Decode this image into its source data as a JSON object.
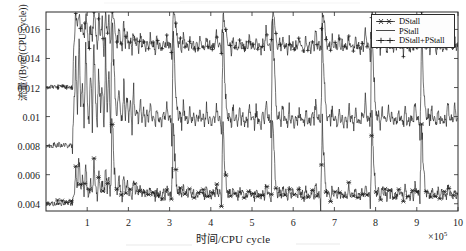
{
  "chart_data": {
    "type": "line",
    "title": "",
    "xlabel": "时间/CPU cycle",
    "ylabel": "流量/(Byte/(CPU cycle))",
    "x_exponent_label": "×10",
    "x_exponent_power": "5",
    "xlim": [
      0,
      10
    ],
    "ylim": [
      0.0035,
      0.0172
    ],
    "grid": false,
    "legend_position": "top-right",
    "x_ticks": [
      1,
      2,
      3,
      4,
      5,
      6,
      7,
      8,
      9,
      10
    ],
    "x_tick_labels": [
      "1",
      "2",
      "3",
      "4",
      "5",
      "6",
      "7",
      "8",
      "9",
      "10"
    ],
    "y_ticks": [
      0.004,
      0.006,
      0.008,
      0.01,
      0.012,
      0.014,
      0.016
    ],
    "y_tick_labels": [
      "0.004",
      "0.006",
      "0.008",
      "0.01",
      "0.012",
      "0.014",
      "0.016"
    ],
    "series": [
      {
        "name": "DStall",
        "marker": "star",
        "color": "#1a1a1a",
        "baseline": 0.00475,
        "values": [
          0.004,
          0.004,
          0.004,
          0.004,
          0.004,
          0.004,
          0.004,
          0.0041,
          0.004,
          0.004,
          0.0041,
          0.004,
          0.0041,
          0.004,
          0.0041,
          0.004,
          0.0041,
          0.0047,
          0.0062,
          0.0052,
          0.0071,
          0.0049,
          0.0058,
          0.0046,
          0.0066,
          0.005,
          0.0044,
          0.0057,
          0.0048,
          0.007,
          0.0052,
          0.0046,
          0.0061,
          0.0049,
          0.0055,
          0.0044,
          0.0068,
          0.005,
          0.0058,
          0.0046,
          0.01,
          0.0068,
          0.0053,
          0.0047,
          0.0058,
          0.005,
          0.0044,
          0.006,
          0.0048,
          0.0055,
          0.0046,
          0.0052,
          0.0044,
          0.0058,
          0.0048,
          0.005,
          0.0045,
          0.0054,
          0.0046,
          0.005,
          0.0044,
          0.0049,
          0.0045,
          0.0052,
          0.0046,
          0.0048,
          0.0044,
          0.005,
          0.0045,
          0.0047,
          0.0044,
          0.0049,
          0.0045,
          0.0051,
          0.0046,
          0.0047,
          0.0044,
          0.0097,
          0.007,
          0.0052,
          0.0046,
          0.005,
          0.0044,
          0.0052,
          0.0046,
          0.0048,
          0.0044,
          0.0051,
          0.0045,
          0.0049,
          0.0044,
          0.0047,
          0.0045,
          0.005,
          0.0046,
          0.0048,
          0.0044,
          0.0051,
          0.0045,
          0.0047,
          0.0044,
          0.0049,
          0.0045,
          0.0053,
          0.0046,
          0.0048,
          0.0044,
          0.0094,
          0.0068,
          0.0051,
          0.0046,
          0.0049,
          0.0044,
          0.0051,
          0.0046,
          0.0047,
          0.0044,
          0.005,
          0.0045,
          0.0048,
          0.0044,
          0.0047,
          0.0045,
          0.0052,
          0.0046,
          0.0048,
          0.0044,
          0.005,
          0.0045,
          0.0047,
          0.0044,
          0.0049,
          0.0045,
          0.0054,
          0.0046,
          0.0048,
          0.0044,
          0.0099,
          0.0072,
          0.0052,
          0.0046,
          0.005,
          0.0044,
          0.0052,
          0.0046,
          0.0048,
          0.0044,
          0.0051,
          0.0045,
          0.0049,
          0.0044,
          0.0047,
          0.0045,
          0.005,
          0.0046,
          0.0048,
          0.0044,
          0.0051,
          0.0045,
          0.0047,
          0.0044,
          0.0049,
          0.0045,
          0.0053,
          0.0046,
          0.0048,
          0.0044,
          0.0096,
          0.007,
          0.0052,
          0.0046,
          0.005,
          0.0044,
          0.0051,
          0.0046,
          0.0047,
          0.0044,
          0.005,
          0.0045,
          0.0048,
          0.0044,
          0.0047,
          0.0045,
          0.0052,
          0.0046,
          0.0048,
          0.0044,
          0.005,
          0.0045,
          0.0047,
          0.0044,
          0.0049,
          0.0045,
          0.0054,
          0.0046,
          0.0048,
          0.0044,
          0.0098,
          0.0071,
          0.0052,
          0.0046,
          0.005,
          0.0044,
          0.0052,
          0.0046,
          0.0048,
          0.0044,
          0.0051,
          0.0045,
          0.0049,
          0.0044,
          0.0047,
          0.0045,
          0.005,
          0.0046,
          0.0048,
          0.0044,
          0.0051,
          0.0045,
          0.0047,
          0.0044,
          0.0049,
          0.0045,
          0.0053,
          0.0046,
          0.0048,
          0.0044,
          0.0095,
          0.0069,
          0.0051,
          0.0046,
          0.0049,
          0.0044,
          0.0051,
          0.0046,
          0.0047,
          0.0044,
          0.005,
          0.0045,
          0.0048,
          0.0044,
          0.0047,
          0.0045,
          0.0052,
          0.0046,
          0.0048,
          0.0044,
          0.005,
          0.0045,
          0.0047
        ]
      },
      {
        "name": "PStall",
        "marker": "none",
        "color": "#1a1a1a",
        "baseline": 0.0101,
        "values": [
          0.008,
          0.008,
          0.008,
          0.008,
          0.008,
          0.0081,
          0.008,
          0.008,
          0.0081,
          0.008,
          0.008,
          0.0081,
          0.008,
          0.008,
          0.0081,
          0.008,
          0.008,
          0.0105,
          0.014,
          0.0112,
          0.0158,
          0.0108,
          0.0128,
          0.0098,
          0.0148,
          0.011,
          0.0094,
          0.0126,
          0.01,
          0.0155,
          0.0112,
          0.0096,
          0.0133,
          0.0102,
          0.012,
          0.0094,
          0.015,
          0.0108,
          0.0128,
          0.0098,
          0.0165,
          0.0135,
          0.011,
          0.01,
          0.012,
          0.0104,
          0.0096,
          0.0124,
          0.01,
          0.0114,
          0.0098,
          0.0108,
          0.0094,
          0.0118,
          0.01,
          0.0105,
          0.0096,
          0.0112,
          0.0098,
          0.0104,
          0.0094,
          0.0102,
          0.0096,
          0.0108,
          0.0098,
          0.01,
          0.0094,
          0.0106,
          0.0096,
          0.0099,
          0.0094,
          0.0102,
          0.0096,
          0.0107,
          0.0098,
          0.01,
          0.0094,
          0.0162,
          0.013,
          0.0108,
          0.0098,
          0.0104,
          0.0094,
          0.0108,
          0.0098,
          0.01,
          0.0094,
          0.0106,
          0.0096,
          0.0102,
          0.0094,
          0.0099,
          0.0096,
          0.0104,
          0.0098,
          0.01,
          0.0094,
          0.0107,
          0.0096,
          0.0099,
          0.0094,
          0.0102,
          0.0096,
          0.011,
          0.0098,
          0.01,
          0.0094,
          0.0158,
          0.0128,
          0.0107,
          0.0098,
          0.0103,
          0.0094,
          0.0107,
          0.0098,
          0.0099,
          0.0094,
          0.0105,
          0.0096,
          0.0101,
          0.0094,
          0.0099,
          0.0096,
          0.0108,
          0.0098,
          0.01,
          0.0094,
          0.0106,
          0.0096,
          0.0099,
          0.0094,
          0.0102,
          0.0096,
          0.0112,
          0.0098,
          0.01,
          0.0094,
          0.0163,
          0.0133,
          0.0108,
          0.0098,
          0.0104,
          0.0094,
          0.0108,
          0.0098,
          0.01,
          0.0094,
          0.0106,
          0.0096,
          0.0102,
          0.0094,
          0.0099,
          0.0096,
          0.0104,
          0.0098,
          0.01,
          0.0094,
          0.0107,
          0.0096,
          0.0099,
          0.0094,
          0.0102,
          0.0096,
          0.011,
          0.0098,
          0.01,
          0.0094,
          0.016,
          0.013,
          0.0108,
          0.0098,
          0.0103,
          0.0094,
          0.0107,
          0.0098,
          0.0099,
          0.0094,
          0.0105,
          0.0096,
          0.0101,
          0.0094,
          0.0099,
          0.0096,
          0.0108,
          0.0098,
          0.01,
          0.0094,
          0.0106,
          0.0096,
          0.0099,
          0.0094,
          0.0102,
          0.0096,
          0.0113,
          0.0098,
          0.01,
          0.0094,
          0.0161,
          0.0132,
          0.0108,
          0.0098,
          0.0104,
          0.0094,
          0.0108,
          0.0098,
          0.01,
          0.0094,
          0.0106,
          0.0096,
          0.0102,
          0.0094,
          0.0099,
          0.0096,
          0.0104,
          0.0098,
          0.01,
          0.0094,
          0.0107,
          0.0096,
          0.0099,
          0.0094,
          0.0102,
          0.0096,
          0.011,
          0.0098,
          0.01,
          0.0094,
          0.0157,
          0.0127,
          0.0107,
          0.0098,
          0.0103,
          0.0094,
          0.0107,
          0.0098,
          0.0099,
          0.0094,
          0.0105,
          0.0096,
          0.0101,
          0.0094,
          0.0099,
          0.0096,
          0.0109,
          0.0098,
          0.01,
          0.0094,
          0.0106,
          0.0096,
          0.0099
        ]
      },
      {
        "name": "DStall+PStall",
        "marker": "plus",
        "color": "#1a1a1a",
        "baseline": 0.0148,
        "values": [
          0.012,
          0.012,
          0.012,
          0.0121,
          0.012,
          0.0121,
          0.012,
          0.0121,
          0.012,
          0.0121,
          0.012,
          0.0121,
          0.012,
          0.0121,
          0.012,
          0.0121,
          0.012,
          0.0152,
          0.017,
          0.0164,
          0.0172,
          0.0157,
          0.0166,
          0.015,
          0.017,
          0.016,
          0.0146,
          0.0167,
          0.0152,
          0.0171,
          0.0162,
          0.0148,
          0.0168,
          0.0154,
          0.0165,
          0.0146,
          0.017,
          0.0158,
          0.0166,
          0.015,
          0.0172,
          0.0168,
          0.0156,
          0.0148,
          0.0162,
          0.0152,
          0.0146,
          0.0164,
          0.015,
          0.0158,
          0.0147,
          0.0155,
          0.0145,
          0.016,
          0.0149,
          0.0152,
          0.0146,
          0.0157,
          0.0148,
          0.0153,
          0.0145,
          0.0151,
          0.0146,
          0.0155,
          0.0148,
          0.015,
          0.0145,
          0.0154,
          0.0147,
          0.015,
          0.0145,
          0.0151,
          0.0146,
          0.0155,
          0.0148,
          0.015,
          0.0145,
          0.0172,
          0.0166,
          0.0157,
          0.0148,
          0.0153,
          0.0145,
          0.0156,
          0.0148,
          0.015,
          0.0145,
          0.0154,
          0.0147,
          0.0151,
          0.0145,
          0.015,
          0.0146,
          0.0153,
          0.0148,
          0.015,
          0.0145,
          0.0155,
          0.0147,
          0.015,
          0.0145,
          0.0151,
          0.0146,
          0.0158,
          0.0148,
          0.015,
          0.0145,
          0.0171,
          0.0165,
          0.0156,
          0.0148,
          0.0152,
          0.0145,
          0.0155,
          0.0148,
          0.015,
          0.0145,
          0.0154,
          0.0147,
          0.0151,
          0.0145,
          0.015,
          0.0146,
          0.0156,
          0.0148,
          0.015,
          0.0145,
          0.0154,
          0.0147,
          0.015,
          0.0145,
          0.0151,
          0.0146,
          0.016,
          0.0148,
          0.015,
          0.0145,
          0.0172,
          0.0167,
          0.0157,
          0.0148,
          0.0153,
          0.0145,
          0.0156,
          0.0148,
          0.015,
          0.0145,
          0.0154,
          0.0147,
          0.0151,
          0.0145,
          0.015,
          0.0146,
          0.0153,
          0.0148,
          0.015,
          0.0145,
          0.0155,
          0.0147,
          0.015,
          0.0145,
          0.0151,
          0.0146,
          0.0158,
          0.0148,
          0.015,
          0.0145,
          0.0171,
          0.0166,
          0.0157,
          0.0148,
          0.0152,
          0.0145,
          0.0155,
          0.0148,
          0.015,
          0.0145,
          0.0154,
          0.0147,
          0.0151,
          0.0145,
          0.015,
          0.0146,
          0.0156,
          0.0148,
          0.015,
          0.0145,
          0.0154,
          0.0147,
          0.015,
          0.0145,
          0.0151,
          0.0146,
          0.0161,
          0.0148,
          0.015,
          0.0145,
          0.0172,
          0.0166,
          0.0157,
          0.0148,
          0.0153,
          0.0145,
          0.0156,
          0.0148,
          0.015,
          0.0145,
          0.0154,
          0.0147,
          0.0151,
          0.0145,
          0.015,
          0.0146,
          0.0153,
          0.0148,
          0.015,
          0.0145,
          0.0155,
          0.0147,
          0.015,
          0.0145,
          0.0151,
          0.0146,
          0.0158,
          0.0148,
          0.015,
          0.0145,
          0.017,
          0.0164,
          0.0156,
          0.0148,
          0.0152,
          0.0145,
          0.0155,
          0.0148,
          0.015,
          0.0145,
          0.0154,
          0.0147,
          0.0151,
          0.0145,
          0.015,
          0.0146,
          0.0157,
          0.0148,
          0.015,
          0.0145,
          0.0154,
          0.0147,
          0.015
        ]
      }
    ]
  },
  "legend": {
    "entries": [
      {
        "label": "DStall",
        "marker": "star"
      },
      {
        "label": "PStall",
        "marker": "line"
      },
      {
        "label": "DStall+PStall",
        "marker": "plus"
      }
    ]
  }
}
